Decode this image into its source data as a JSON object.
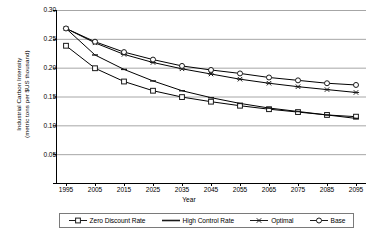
{
  "chart_data": {
    "type": "line",
    "title": "",
    "xlabel": "Year",
    "ylabel": "Industrial Carbon Intensity (metric tons per $US thousand)",
    "ylabel_line1": "Industrial Carbon Intensity",
    "ylabel_line2": "(metric tons per $US thousand)",
    "x": [
      1995,
      2005,
      2015,
      2025,
      2035,
      2045,
      2055,
      2065,
      2075,
      2085,
      2095
    ],
    "xtick_labels": [
      "1995",
      "2005",
      "2015",
      "2025",
      "2035",
      "2045",
      "2055",
      "2065",
      "2075",
      "2085",
      "2095"
    ],
    "ytick_labels": [
      "0.30",
      "0.25",
      "0.20",
      "0.15",
      "0.10",
      "0.05",
      "-"
    ],
    "ytick_values": [
      0.3,
      0.25,
      0.2,
      0.15,
      0.1,
      0.05,
      0.0
    ],
    "ylim": [
      0.0,
      0.3
    ],
    "xlim": [
      1995,
      2095
    ],
    "grid": "horizontal",
    "legend_position": "bottom",
    "series": [
      {
        "name": "Zero Discount Rate",
        "marker": "square",
        "color": "#000000",
        "values": [
          0.238,
          0.199,
          0.176,
          0.16,
          0.149,
          0.141,
          0.134,
          0.128,
          0.123,
          0.118,
          0.115
        ]
      },
      {
        "name": "High Control Rate",
        "marker": "none",
        "color": "#000000",
        "values": [
          0.268,
          0.222,
          0.197,
          0.177,
          0.16,
          0.148,
          0.138,
          0.13,
          0.124,
          0.118,
          0.112
        ]
      },
      {
        "name": "Optimal",
        "marker": "asterisk",
        "color": "#000000",
        "values": [
          0.268,
          0.243,
          0.223,
          0.209,
          0.198,
          0.189,
          0.18,
          0.173,
          0.167,
          0.162,
          0.157
        ]
      },
      {
        "name": "Base",
        "marker": "circle",
        "color": "#000000",
        "values": [
          0.268,
          0.245,
          0.227,
          0.214,
          0.203,
          0.196,
          0.19,
          0.183,
          0.178,
          0.173,
          0.17
        ]
      }
    ]
  },
  "legend": {
    "items": [
      {
        "label": "Zero Discount Rate",
        "marker": "square"
      },
      {
        "label": "High Control Rate",
        "marker": "none"
      },
      {
        "label": "Optimal",
        "marker": "asterisk"
      },
      {
        "label": "Base",
        "marker": "circle"
      }
    ]
  },
  "colors": {
    "line": "#1a1a1a",
    "grid": "#a6a6a6",
    "axis": "#000000",
    "background": "#ffffff"
  }
}
